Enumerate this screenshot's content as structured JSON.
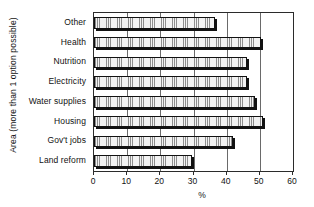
{
  "chart_data": {
    "type": "bar",
    "orientation": "horizontal",
    "title": "",
    "subtitle": "",
    "xlabel": "%",
    "ylabel": "Area (more than 1 option possible)",
    "xlim": [
      0,
      60
    ],
    "ylim": null,
    "xticks": [
      0,
      10,
      20,
      30,
      40,
      50,
      60
    ],
    "xtick_labels": [
      "0",
      "10",
      "20",
      "30",
      "40",
      "50",
      "60"
    ],
    "grid": "vertical-only",
    "legend": null,
    "legend_position": "none",
    "categories": [
      "Other",
      "Health",
      "Nutrition",
      "Electricity",
      "Water supplies",
      "Housing",
      "Gov't jobs",
      "Land reform"
    ],
    "values": [
      36.5,
      50.5,
      46.0,
      46.0,
      48.5,
      51.0,
      42.0,
      29.5
    ],
    "series": [
      {
        "name": "Percent of respondents",
        "values": [
          36.5,
          50.5,
          46.0,
          46.0,
          48.5,
          51.0,
          42.0,
          29.5
        ]
      }
    ],
    "annotations": [],
    "style": {
      "bar_fill": "#f2f2f2",
      "bar_fill_pattern": "fine-dotted-grid",
      "bar_outline": "#111111",
      "bar_shadow": "#111111",
      "axis_color": "#2b2b2b",
      "gridline_color": "#6a6a6a",
      "background": "#ffffff"
    }
  }
}
